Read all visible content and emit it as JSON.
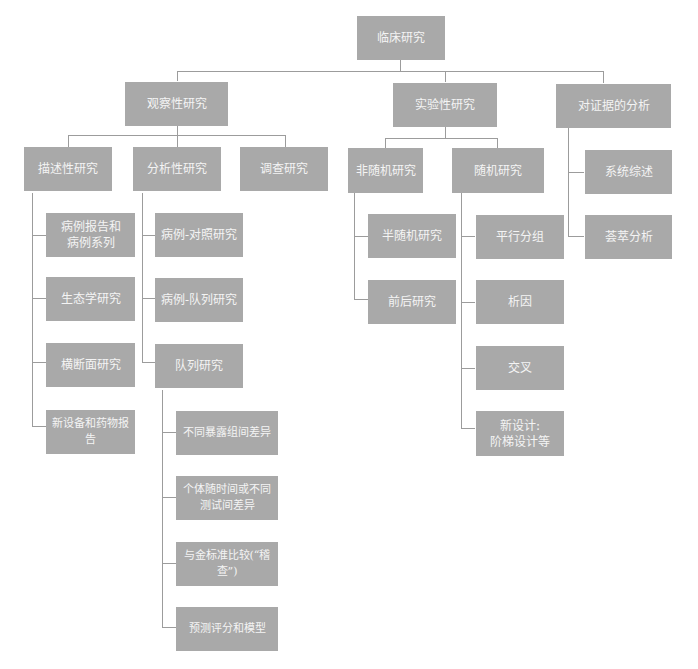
{
  "root": {
    "label": "临床研究"
  },
  "level1": [
    {
      "label": "观察性研究"
    },
    {
      "label": "实验性研究"
    },
    {
      "label": "对证据的分析"
    }
  ],
  "observational": {
    "children": [
      {
        "label": "描述性研究"
      },
      {
        "label": "分析性研究"
      },
      {
        "label": "调查研究"
      }
    ],
    "descriptive": [
      {
        "label": "病例报告和\n病例系列"
      },
      {
        "label": "生态学研究"
      },
      {
        "label": "横断面研究"
      },
      {
        "label": "新设备和药物报告"
      }
    ],
    "analytic": [
      {
        "label": "病例-对照研究"
      },
      {
        "label": "病例-队列研究"
      },
      {
        "label": "队列研究"
      }
    ],
    "cohort": [
      {
        "label": "不同暴露组间差异"
      },
      {
        "label": "个体随时间或不同\n测试间差异"
      },
      {
        "label": "与金标准比较(“稽查”)"
      },
      {
        "label": "预测评分和模型"
      }
    ]
  },
  "experimental": {
    "children": [
      {
        "label": "非随机研究"
      },
      {
        "label": "随机研究"
      }
    ],
    "nonrandom": [
      {
        "label": "半随机研究"
      },
      {
        "label": "前后研究"
      }
    ],
    "random": [
      {
        "label": "平行分组"
      },
      {
        "label": "析因"
      },
      {
        "label": "交叉"
      },
      {
        "label": "新设计:\n阶梯设计等"
      }
    ]
  },
  "evidence": {
    "children": [
      {
        "label": "系统综述"
      },
      {
        "label": "荟萃分析"
      }
    ]
  },
  "colors": {
    "box": "#a9a9a9",
    "text": "#f4f4f4",
    "line": "#9c9c9c"
  }
}
